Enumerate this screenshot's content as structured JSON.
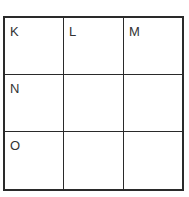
{
  "grid": {
    "rows": 3,
    "cols": 3,
    "cells": [
      [
        "K",
        "L",
        "M"
      ],
      [
        "N",
        "",
        ""
      ],
      [
        "O",
        "",
        ""
      ]
    ]
  }
}
